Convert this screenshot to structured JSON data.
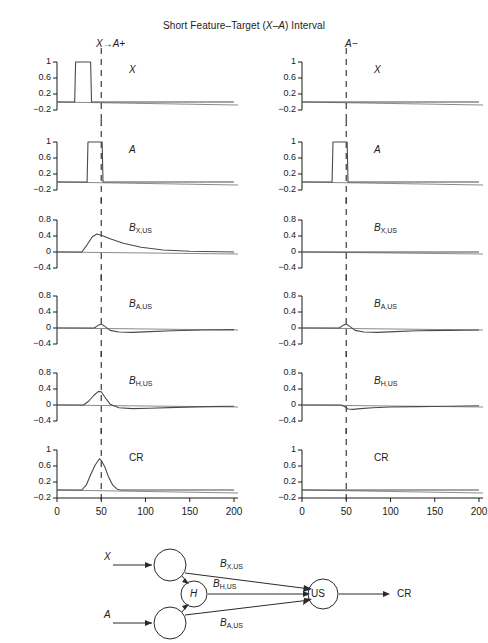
{
  "figure": {
    "title_pre": "Short Feature",
    "title_dash1": "–",
    "title_mid": "Target (",
    "title_xa": "X–A",
    "title_post": ") Interval"
  },
  "columns": [
    {
      "key": "left",
      "header": "X→A+"
    },
    {
      "key": "right",
      "header": "A−"
    }
  ],
  "axes": {
    "xticks": [
      "0",
      "50",
      "100",
      "150",
      "200"
    ],
    "xtick_values": [
      0,
      50,
      100,
      150,
      200
    ],
    "xlim": [
      0,
      200
    ],
    "yticks_signal": [
      "1",
      "0.6",
      "0.2",
      "-0.2"
    ],
    "yticks_signal_values": [
      1,
      0.6,
      0.2,
      -0.2
    ],
    "ylim_signal": [
      -0.2,
      1
    ],
    "yticks_assoc": [
      "0.8",
      "0.4",
      "0",
      "-0.4"
    ],
    "yticks_assoc_values": [
      0.8,
      0.4,
      0,
      -0.4
    ],
    "ylim_assoc": [
      -0.4,
      0.8
    ],
    "dashed_marker_x": 50
  },
  "rows": [
    {
      "key": "X",
      "caption_base": "X",
      "caption_sub": "",
      "axis": "signal"
    },
    {
      "key": "A",
      "caption_base": "A",
      "caption_sub": "",
      "axis": "signal"
    },
    {
      "key": "BXUS",
      "caption_base": "B",
      "caption_sub": "X,US",
      "axis": "assoc"
    },
    {
      "key": "BAUS",
      "caption_base": "B",
      "caption_sub": "A,US",
      "axis": "assoc"
    },
    {
      "key": "BHUS",
      "caption_base": "B",
      "caption_sub": "H,US",
      "axis": "assoc"
    },
    {
      "key": "CR",
      "caption_base": "CR",
      "caption_sub": "",
      "axis": "signal"
    }
  ],
  "chart_data": {
    "type": "line",
    "title": "Short Feature–Target (X–A) Interval",
    "xlabel": "",
    "ylabel": "",
    "xlim": [
      0,
      200
    ],
    "grid": false,
    "legend": "none",
    "dashed_vertical_line_x": 50,
    "panels": [
      {
        "column": "X→A+",
        "row": "X",
        "ylim": [
          -0.2,
          1
        ],
        "yticks": [
          1,
          0.6,
          0.2,
          -0.2
        ],
        "xticks": [
          0,
          50,
          100,
          150,
          200
        ],
        "x": [
          0,
          20,
          21,
          38,
          39,
          200
        ],
        "y": [
          0,
          0,
          1,
          1,
          0,
          0
        ]
      },
      {
        "column": "X→A+",
        "row": "A",
        "ylim": [
          -0.2,
          1
        ],
        "yticks": [
          1,
          0.6,
          0.2,
          -0.2
        ],
        "xticks": [
          0,
          50,
          100,
          150,
          200
        ],
        "x": [
          0,
          34,
          35,
          51,
          52,
          200
        ],
        "y": [
          0,
          0,
          1,
          1,
          0,
          0
        ]
      },
      {
        "column": "X→A+",
        "row": "B_X,US",
        "ylim": [
          -0.4,
          0.8
        ],
        "yticks": [
          0.8,
          0.4,
          0,
          -0.4
        ],
        "xticks": [
          0,
          50,
          100,
          150,
          200
        ],
        "x": [
          0,
          28,
          34,
          40,
          45,
          50,
          60,
          75,
          95,
          120,
          150,
          200
        ],
        "y": [
          0,
          0,
          0.18,
          0.38,
          0.45,
          0.42,
          0.33,
          0.22,
          0.12,
          0.05,
          0.02,
          0
        ]
      },
      {
        "column": "X→A+",
        "row": "B_A,US",
        "ylim": [
          -0.4,
          0.8
        ],
        "yticks": [
          0.8,
          0.4,
          0,
          -0.4
        ],
        "xticks": [
          0,
          50,
          100,
          150,
          200
        ],
        "x": [
          0,
          42,
          46,
          50,
          54,
          60,
          70,
          85,
          105,
          130,
          165,
          200
        ],
        "y": [
          0,
          0,
          0.06,
          0.1,
          0.04,
          -0.06,
          -0.1,
          -0.11,
          -0.09,
          -0.07,
          -0.05,
          -0.04
        ]
      },
      {
        "column": "X→A+",
        "row": "B_H,US",
        "ylim": [
          -0.4,
          0.8
        ],
        "yticks": [
          0.8,
          0.4,
          0,
          -0.4
        ],
        "xticks": [
          0,
          50,
          100,
          150,
          200
        ],
        "x": [
          0,
          30,
          36,
          42,
          47,
          50,
          54,
          60,
          70,
          85,
          105,
          135,
          170,
          200
        ],
        "y": [
          0,
          0,
          0.1,
          0.25,
          0.34,
          0.33,
          0.2,
          0.02,
          -0.07,
          -0.09,
          -0.08,
          -0.06,
          -0.04,
          -0.03
        ]
      },
      {
        "column": "X→A+",
        "row": "CR",
        "ylim": [
          -0.2,
          1
        ],
        "yticks": [
          1,
          0.6,
          0.2,
          -0.2
        ],
        "xticks": [
          0,
          50,
          100,
          150,
          200
        ],
        "x": [
          0,
          28,
          33,
          38,
          43,
          48,
          50,
          54,
          58,
          63,
          68,
          72,
          200
        ],
        "y": [
          0,
          0,
          0.12,
          0.38,
          0.62,
          0.78,
          0.74,
          0.58,
          0.34,
          0.12,
          0.02,
          0,
          0
        ]
      },
      {
        "column": "A−",
        "row": "X",
        "ylim": [
          -0.2,
          1
        ],
        "yticks": [
          1,
          0.6,
          0.2,
          -0.2
        ],
        "xticks": [
          0,
          50,
          100,
          150,
          200
        ],
        "x": [
          0,
          200
        ],
        "y": [
          0,
          0
        ]
      },
      {
        "column": "A−",
        "row": "A",
        "ylim": [
          -0.2,
          1
        ],
        "yticks": [
          1,
          0.6,
          0.2,
          -0.2
        ],
        "xticks": [
          0,
          50,
          100,
          150,
          200
        ],
        "x": [
          0,
          34,
          35,
          51,
          52,
          200
        ],
        "y": [
          0,
          0,
          1,
          1,
          0,
          0
        ]
      },
      {
        "column": "A−",
        "row": "B_X,US",
        "ylim": [
          -0.4,
          0.8
        ],
        "yticks": [
          0.8,
          0.4,
          0,
          -0.4
        ],
        "xticks": [
          0,
          50,
          100,
          150,
          200
        ],
        "x": [
          0,
          200
        ],
        "y": [
          0,
          0
        ]
      },
      {
        "column": "A−",
        "row": "B_A,US",
        "ylim": [
          -0.4,
          0.8
        ],
        "yticks": [
          0.8,
          0.4,
          0,
          -0.4
        ],
        "xticks": [
          0,
          50,
          100,
          150,
          200
        ],
        "x": [
          0,
          42,
          46,
          50,
          54,
          60,
          70,
          85,
          105,
          130,
          165,
          200
        ],
        "y": [
          0,
          0,
          0.06,
          0.1,
          0.04,
          -0.06,
          -0.1,
          -0.11,
          -0.09,
          -0.07,
          -0.06,
          -0.05
        ]
      },
      {
        "column": "A−",
        "row": "B_H,US",
        "ylim": [
          -0.4,
          0.8
        ],
        "yticks": [
          0.8,
          0.4,
          0,
          -0.4
        ],
        "xticks": [
          0,
          50,
          100,
          150,
          200
        ],
        "x": [
          0,
          44,
          48,
          52,
          58,
          66,
          80,
          100,
          130,
          165,
          200
        ],
        "y": [
          0,
          0,
          -0.04,
          -0.1,
          -0.11,
          -0.09,
          -0.07,
          -0.05,
          -0.04,
          -0.03,
          -0.02
        ]
      },
      {
        "column": "A−",
        "row": "CR",
        "ylim": [
          -0.2,
          1
        ],
        "yticks": [
          1,
          0.6,
          0.2,
          -0.2
        ],
        "xticks": [
          0,
          50,
          100,
          150,
          200
        ],
        "x": [
          0,
          200
        ],
        "y": [
          0,
          0
        ]
      }
    ]
  },
  "diagram": {
    "input_x_label": "X",
    "input_a_label": "A",
    "hidden_label": "H",
    "us_label": "US",
    "output_label": "CR",
    "weights": [
      {
        "base": "B",
        "sub": "X,US"
      },
      {
        "base": "B",
        "sub": "H,US"
      },
      {
        "base": "B",
        "sub": "A,US"
      }
    ]
  },
  "colors": {
    "ink": "#1a1a1a",
    "trace": "#4a4a4a",
    "baseline": "#8a8a8a",
    "dashed": "#3a3a3a"
  }
}
